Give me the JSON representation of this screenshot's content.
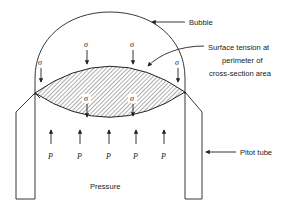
{
  "diagram": {
    "labels": {
      "bubble": "Bubble",
      "surface_tension": [
        "Surface tension at",
        "perimeter of",
        "cross-section area"
      ],
      "pitot_tube": "Pitot tube",
      "pressure": "Pressure"
    },
    "symbols": {
      "sigma": "σ",
      "pressure": "P"
    },
    "sigma_count_top": 4,
    "sigma_count_inner": 2,
    "pressure_arrow_count": 5
  }
}
